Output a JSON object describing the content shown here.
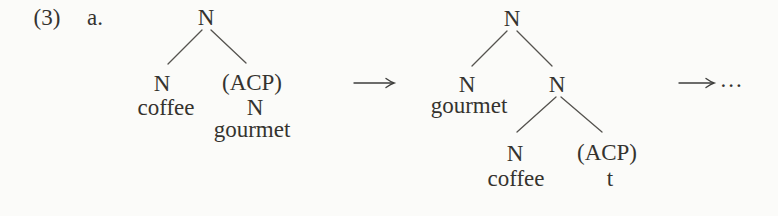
{
  "page": {
    "background": "#fbfbf9",
    "text_color": "#35332f",
    "edge_color": "#55534f",
    "arrow_color": "#3e3e3c"
  },
  "example": {
    "number": "(3)",
    "letter": "a."
  },
  "derivation": {
    "tree1": {
      "root": "N",
      "left": {
        "node": "N",
        "terminal": "coffee"
      },
      "right": {
        "node": "(ACP)",
        "subnode": "N",
        "terminal": "gourmet"
      }
    },
    "arrow1_icon": "long-right-arrow",
    "tree2": {
      "root": "N",
      "left": {
        "node": "N",
        "terminal": "gourmet"
      },
      "right": {
        "node": "N",
        "left": {
          "node": "N",
          "terminal": "coffee"
        },
        "right": {
          "node": "(ACP)",
          "terminal": "t"
        }
      }
    },
    "arrow2_icon": "long-right-arrow",
    "ellipsis": "..."
  }
}
